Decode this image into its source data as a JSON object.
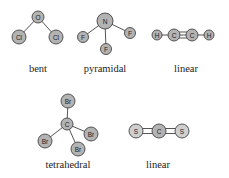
{
  "colors": {
    "atom_fill": "#b3b3b3",
    "atom_fill_light": "#cfcfcf",
    "atom_stroke": "#444444",
    "bond": "#555555",
    "text": "#222222"
  },
  "molecules": [
    {
      "name": "OCl2",
      "shape_label": "bent",
      "atoms": [
        {
          "symbol": "O",
          "x": 38,
          "y": 17,
          "r": 6
        },
        {
          "symbol": "Cl",
          "x": 19,
          "y": 37,
          "r": 7
        },
        {
          "symbol": "Cl",
          "x": 56,
          "y": 37,
          "r": 7
        }
      ],
      "bonds": [
        [
          0,
          1,
          1
        ],
        [
          0,
          2,
          1
        ]
      ],
      "label_pos": {
        "x": 38,
        "y": 72
      }
    },
    {
      "name": "NF3",
      "shape_label": "pyramidal",
      "atoms": [
        {
          "symbol": "N",
          "x": 105,
          "y": 21,
          "r": 8
        },
        {
          "symbol": "F",
          "x": 83,
          "y": 37,
          "r": 5.5
        },
        {
          "symbol": "F",
          "x": 106,
          "y": 49,
          "r": 5.5
        },
        {
          "symbol": "F",
          "x": 130,
          "y": 33,
          "r": 5.5
        }
      ],
      "bonds": [
        [
          0,
          1,
          1
        ],
        [
          0,
          2,
          1
        ],
        [
          0,
          3,
          1
        ]
      ],
      "label_pos": {
        "x": 105,
        "y": 72
      }
    },
    {
      "name": "C2H2",
      "shape_label": "linear",
      "atoms": [
        {
          "symbol": "H",
          "x": 157,
          "y": 35,
          "r": 5
        },
        {
          "symbol": "C",
          "x": 174,
          "y": 35,
          "r": 6
        },
        {
          "symbol": "C",
          "x": 192,
          "y": 35,
          "r": 6
        },
        {
          "symbol": "H",
          "x": 209,
          "y": 35,
          "r": 5
        }
      ],
      "bonds": [
        [
          0,
          1,
          1
        ],
        [
          1,
          2,
          3
        ],
        [
          2,
          3,
          1
        ]
      ],
      "label_pos": {
        "x": 186,
        "y": 72
      }
    },
    {
      "name": "CBr4",
      "shape_label": "tetrahedral",
      "atoms": [
        {
          "symbol": "C",
          "x": 67,
          "y": 124,
          "r": 6
        },
        {
          "symbol": "Br",
          "x": 68,
          "y": 101,
          "r": 7
        },
        {
          "symbol": "Br",
          "x": 45,
          "y": 141,
          "r": 7
        },
        {
          "symbol": "Br",
          "x": 91,
          "y": 134,
          "r": 7
        },
        {
          "symbol": "Br",
          "x": 78,
          "y": 149,
          "r": 7
        }
      ],
      "bonds": [
        [
          0,
          1,
          1
        ],
        [
          0,
          2,
          1
        ],
        [
          0,
          3,
          1
        ],
        [
          0,
          4,
          1
        ]
      ],
      "label_pos": {
        "x": 68,
        "y": 168
      }
    },
    {
      "name": "CS2",
      "shape_label": "linear",
      "atoms": [
        {
          "symbol": "S",
          "x": 136,
          "y": 131,
          "r": 7,
          "light": true
        },
        {
          "symbol": "C",
          "x": 159,
          "y": 131,
          "r": 7
        },
        {
          "symbol": "S",
          "x": 182,
          "y": 131,
          "r": 7,
          "light": true
        }
      ],
      "bonds": [
        [
          0,
          1,
          2
        ],
        [
          1,
          2,
          2
        ]
      ],
      "label_pos": {
        "x": 158,
        "y": 168
      }
    }
  ]
}
